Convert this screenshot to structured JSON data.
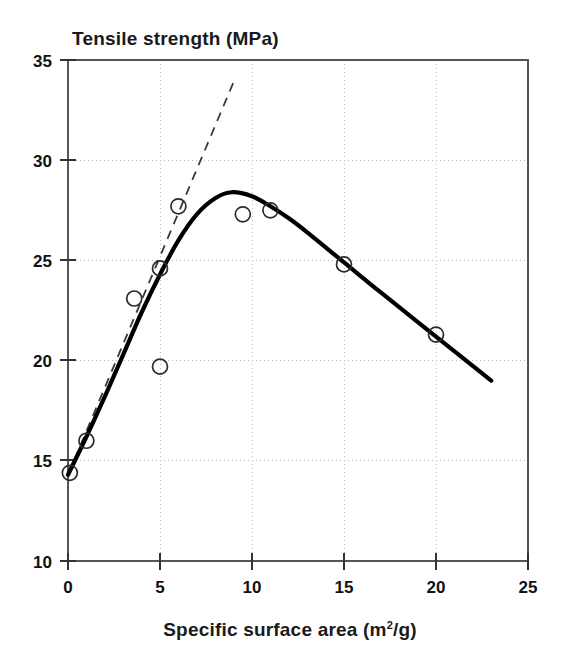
{
  "chart_data": {
    "type": "scatter",
    "title": "",
    "ylabel": "Tensile strength (MPa)",
    "xlabel_parts": {
      "before": "Specific surface area (m",
      "superscript": "2",
      "after": "/g)"
    },
    "xlabel": "Specific surface area (m2/g)",
    "xlim": [
      0,
      25
    ],
    "ylim": [
      10,
      35
    ],
    "xticks": [
      0,
      5,
      10,
      15,
      20,
      25
    ],
    "xtick_labels": [
      "0",
      "5",
      "10",
      "15",
      "20",
      "25"
    ],
    "yticks": [
      10,
      15,
      20,
      25,
      30,
      35
    ],
    "ytick_labels": [
      "10",
      "15",
      "20",
      "25",
      "30",
      "35"
    ],
    "grid": true,
    "legend": "none",
    "series": [
      {
        "name": "measured data",
        "marker": "open-circle",
        "points": [
          {
            "x": 0.1,
            "y": 14.4
          },
          {
            "x": 1.0,
            "y": 16.0
          },
          {
            "x": 3.6,
            "y": 23.1
          },
          {
            "x": 5.0,
            "y": 24.6
          },
          {
            "x": 5.0,
            "y": 19.7
          },
          {
            "x": 6.0,
            "y": 27.7
          },
          {
            "x": 9.5,
            "y": 27.3
          },
          {
            "x": 11.0,
            "y": 27.5
          },
          {
            "x": 15.0,
            "y": 24.8
          },
          {
            "x": 20.0,
            "y": 21.3
          }
        ]
      },
      {
        "name": "fitted curve",
        "style": "solid-thick",
        "points": [
          {
            "x": 0.0,
            "y": 14.3
          },
          {
            "x": 1.0,
            "y": 16.2
          },
          {
            "x": 2.0,
            "y": 18.2
          },
          {
            "x": 3.0,
            "y": 20.3
          },
          {
            "x": 4.0,
            "y": 22.4
          },
          {
            "x": 5.0,
            "y": 24.3
          },
          {
            "x": 6.0,
            "y": 26.0
          },
          {
            "x": 7.0,
            "y": 27.3
          },
          {
            "x": 8.0,
            "y": 28.1
          },
          {
            "x": 8.9,
            "y": 28.4
          },
          {
            "x": 10.0,
            "y": 28.2
          },
          {
            "x": 11.0,
            "y": 27.7
          },
          {
            "x": 12.0,
            "y": 27.1
          },
          {
            "x": 13.0,
            "y": 26.4
          },
          {
            "x": 15.0,
            "y": 24.9
          },
          {
            "x": 17.0,
            "y": 23.4
          },
          {
            "x": 20.0,
            "y": 21.2
          },
          {
            "x": 23.0,
            "y": 19.0
          }
        ]
      },
      {
        "name": "initial slope tangent",
        "style": "dashed",
        "points": [
          {
            "x": 0.0,
            "y": 14.3
          },
          {
            "x": 9.0,
            "y": 33.9
          }
        ]
      }
    ]
  }
}
